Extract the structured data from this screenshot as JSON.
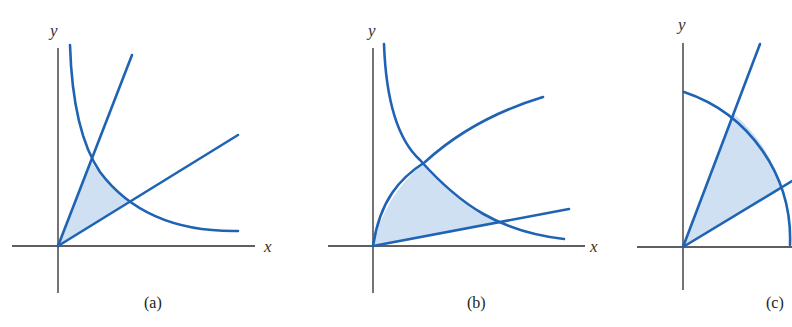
{
  "colors": {
    "curve": "#1f63b4",
    "region_fill": "#cfe0f2",
    "axis": "#2a2a2a",
    "background": "#ffffff"
  },
  "panels": [
    {
      "caption": "(a)",
      "x_label": "x",
      "y_label": "y",
      "description": "Region in first quadrant bounded by two lines through origin and a hyperbola-like decreasing curve"
    },
    {
      "caption": "(b)",
      "x_label": "x",
      "y_label": "y",
      "description": "Region bounded by a concave increasing curve through origin, a line through origin, and a decreasing curve"
    },
    {
      "caption": "(c)",
      "x_label": "x",
      "y_label": "y",
      "description": "Polar sector bounded by two rays from origin and a circular arc"
    }
  ]
}
